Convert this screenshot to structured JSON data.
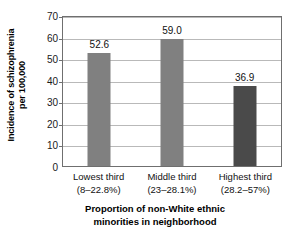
{
  "chart_data": {
    "type": "bar",
    "title": "",
    "categories": [
      "Lowest third",
      "Middle third",
      "Highest third"
    ],
    "category_sublabels": [
      "(8–22.8%)",
      "(23–28.1%)",
      "(28.2–57%)"
    ],
    "values": [
      52.6,
      59.0,
      36.9
    ],
    "value_labels": [
      "52.6",
      "59.0",
      "36.9"
    ],
    "bar_colors": [
      "#808080",
      "#808080",
      "#4a4a4a"
    ],
    "xlabel_line1": "Proportion of non-White ethnic",
    "xlabel_line2": "minorities in neighborhood",
    "ylabel_line1": "Incidence of schizophrenia",
    "ylabel_line2": "per 100,000",
    "ylim": [
      0,
      70
    ],
    "yticks": [
      0,
      10,
      20,
      30,
      40,
      50,
      60,
      70
    ],
    "ytick_labels": [
      "0",
      "10",
      "20",
      "30",
      "40",
      "50",
      "60",
      "70"
    ],
    "grid": true,
    "grid_color": "#b9b9b9",
    "axis_color": "#6f6f6f",
    "legend": "none",
    "background": "#ffffff"
  }
}
